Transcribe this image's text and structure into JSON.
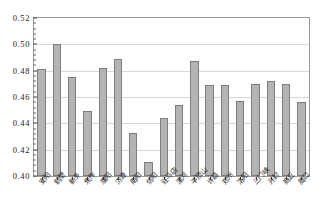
{
  "chart_data": {
    "type": "bar",
    "title": "",
    "subtitle": "",
    "xlabel": "",
    "ylabel": "",
    "ylim": [
      0.4,
      0.52
    ],
    "ytick_step": 0.02,
    "yticks": [
      "0.40",
      "0.42",
      "0.44",
      "0.46",
      "0.48",
      "0.50",
      "0.52"
    ],
    "ytick_values": [
      0.4,
      0.42,
      0.44,
      0.46,
      0.48,
      0.5,
      0.52
    ],
    "minor_ticks_per_major": 5,
    "grid": "horizontal",
    "legend": "none",
    "bar_color": "#b4b4b4",
    "bar_edge_color": "#7d7d7d",
    "categories": [
      "安阳",
      "鹤壁",
      "新乡",
      "焦作",
      "濮阳",
      "济源",
      "南阳",
      "信阳",
      "驻马店",
      "漯河",
      "平顶山",
      "许昌",
      "郑州",
      "洛阳",
      "三门峡",
      "开封",
      "商丘",
      "周口"
    ],
    "values": [
      0.481,
      0.5,
      0.475,
      0.449,
      0.482,
      0.489,
      0.433,
      0.411,
      0.444,
      0.454,
      0.487,
      0.469,
      0.469,
      0.457,
      0.47,
      0.472,
      0.47,
      0.456
    ]
  }
}
